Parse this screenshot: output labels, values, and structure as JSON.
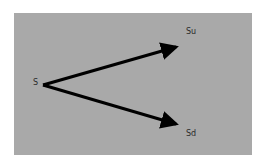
{
  "diagram": {
    "type": "binomial-tree-one-step",
    "background_color": "#a9a9a9",
    "arrow_color": "#000000",
    "nodes": {
      "root": {
        "label": "S"
      },
      "up": {
        "label": "Su"
      },
      "down": {
        "label": "Sd"
      }
    },
    "edges": [
      {
        "from": "S",
        "to": "Su"
      },
      {
        "from": "S",
        "to": "Sd"
      }
    ]
  }
}
